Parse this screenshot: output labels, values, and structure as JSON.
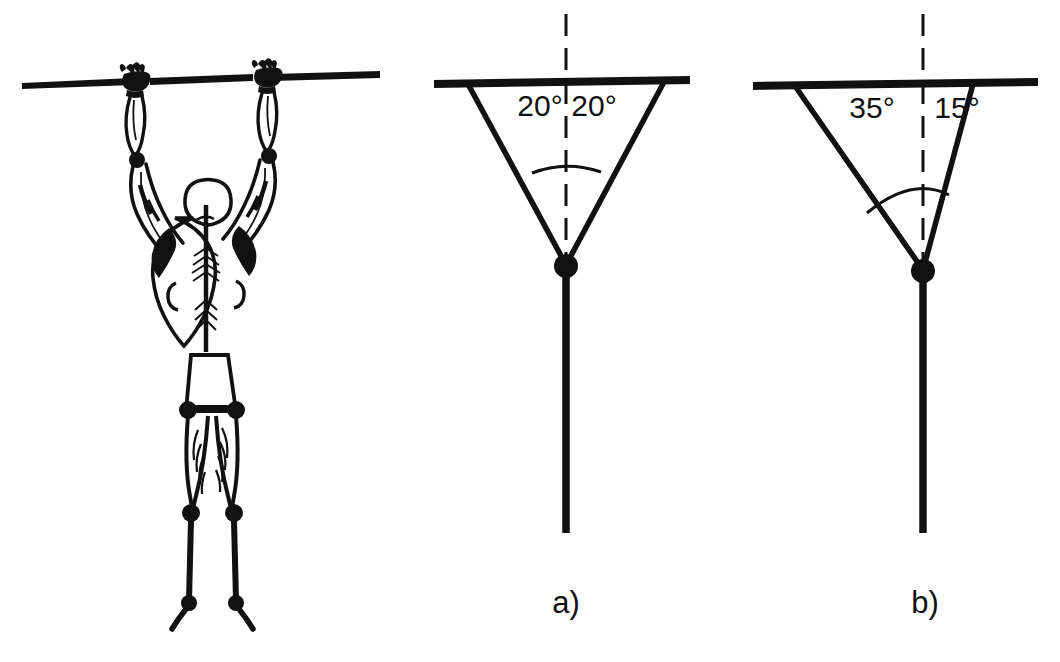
{
  "figure": {
    "background_color": "#ffffff",
    "ink_color": "#111111",
    "panels": [
      {
        "id": "anatomy",
        "caption": "",
        "description": "line drawing of a person hanging from a horizontal bar, rear view showing back musculature"
      },
      {
        "id": "schematic-a",
        "caption": "a)",
        "caption_x": 566,
        "caption_y": 613,
        "vertex": {
          "x": 566,
          "y": 265
        },
        "bar": {
          "x1": 434,
          "x2": 690,
          "y": 83
        },
        "dashed_axis": {
          "x": 566,
          "y_top": 14,
          "y_bottom": 262
        },
        "stem": {
          "x": 566,
          "y_top": 265,
          "y_bottom": 533
        },
        "arms": [
          {
            "side": "left",
            "x_top": 468,
            "y_top": 88,
            "angle_deg": 20
          },
          {
            "side": "right",
            "x_top": 664,
            "y_top": 88,
            "angle_deg": 20
          }
        ],
        "arc": {
          "cx": 566,
          "cy": 265,
          "r": 98,
          "start_deg": 20,
          "end_deg": 20
        },
        "angle_labels": [
          {
            "text": "20°",
            "x": 540,
            "y": 116,
            "side": "left"
          },
          {
            "text": "20°",
            "x": 593,
            "y": 116,
            "side": "right"
          }
        ]
      },
      {
        "id": "schematic-b",
        "caption": "b)",
        "caption_x": 925,
        "caption_y": 613,
        "vertex": {
          "x": 923,
          "y": 270
        },
        "bar": {
          "x1": 753,
          "x2": 1038,
          "y": 85
        },
        "dashed_axis": {
          "x": 923,
          "y_top": 14,
          "y_bottom": 266
        },
        "stem": {
          "x": 923,
          "y_top": 270,
          "y_bottom": 533
        },
        "arms": [
          {
            "side": "left",
            "x_top": 795,
            "y_top": 90,
            "angle_deg": 35
          },
          {
            "side": "right",
            "x_top": 973,
            "y_top": 90,
            "angle_deg": 15
          }
        ],
        "arc": {
          "cx": 923,
          "cy": 270,
          "r": 100,
          "start_deg": 35,
          "end_deg": 15
        },
        "angle_labels": [
          {
            "text": "35°",
            "x": 872,
            "y": 118,
            "side": "left"
          },
          {
            "text": "15°",
            "x": 956,
            "y": 118,
            "side": "right"
          }
        ]
      }
    ]
  }
}
